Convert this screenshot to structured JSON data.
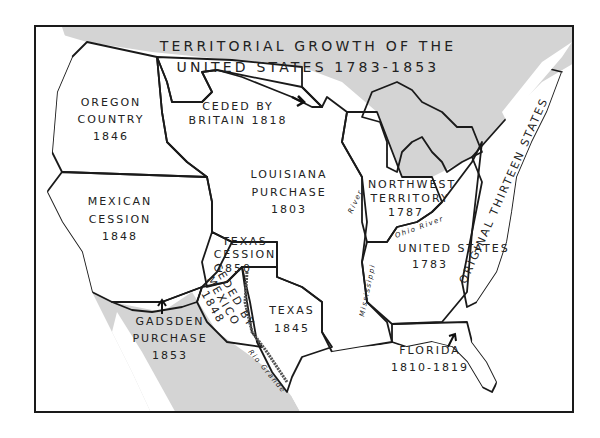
{
  "title": {
    "line1": "TERRITORIAL GROWTH OF THE",
    "line2": "UNITED STATES 1783-1853"
  },
  "regions": [
    {
      "id": "oregon",
      "name": "OREGON",
      "name2": "COUNTRY",
      "year": "1846"
    },
    {
      "id": "britain",
      "name": "CEDED BY",
      "name2": "BRITAIN 1818"
    },
    {
      "id": "louisiana",
      "name": "LOUISIANA",
      "name2": "PURCHASE",
      "year": "1803"
    },
    {
      "id": "northwest",
      "name": "NORTHWEST",
      "name2": "TERRITORY",
      "year": "1787"
    },
    {
      "id": "mexican",
      "name": "MEXICAN",
      "name2": "CESSION",
      "year": "1848"
    },
    {
      "id": "texas_cession",
      "name": "TEXAS",
      "name2": "CESSION",
      "year": "1850"
    },
    {
      "id": "ceded_mexico",
      "name": "CEDED BY",
      "name2": "MEXICO",
      "year": "1848"
    },
    {
      "id": "texas",
      "name": "TEXAS",
      "year": "1845"
    },
    {
      "id": "us1783",
      "name": "UNITED STATES",
      "year": "1783"
    },
    {
      "id": "original13",
      "name": "ORIGINAL THIRTEEN STATES"
    },
    {
      "id": "gadsden",
      "name": "GADSDEN",
      "name2": "PURCHASE",
      "year": "1853"
    },
    {
      "id": "florida",
      "name": "FLORIDA",
      "year": "1810-1819"
    }
  ],
  "rivers": {
    "mississippi": "Mississippi",
    "ohio": "Ohio River",
    "river_label": "River",
    "rio_grande": "Rio Grande"
  },
  "colors": {
    "frame": "#1a1a1a",
    "water": "#ffffff",
    "foreign_land": "#d4d4d4",
    "acquired_land": "#a9a9a9",
    "us1783": "#8f8f8f",
    "hatch": "#3a3a3a",
    "text": "#222222"
  }
}
